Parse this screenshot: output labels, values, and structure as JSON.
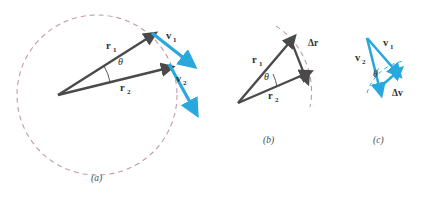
{
  "figure": {
    "type": "physics-vector-diagram",
    "background_color": "#ffffff",
    "panels": [
      {
        "id": "a",
        "caption": "(a)",
        "caption_x": 96,
        "caption_y": 178,
        "description": "Circle with two position vectors r1 and r2 from center separated by angle theta, and tangent velocity vectors v1 and v2 at their tips"
      },
      {
        "id": "b",
        "caption": "(b)",
        "caption_x": 268,
        "caption_y": 140,
        "description": "Triangle of r1 and r2 with displacement vector delta-r joining their tips, arc of circle dashed"
      },
      {
        "id": "c",
        "caption": "(c)",
        "caption_x": 378,
        "caption_y": 140,
        "description": "Triangle of v1 and v2 with velocity-change vector delta-v joining their tips, arc dashed"
      }
    ],
    "labels": {
      "r1": "r",
      "r1_sub": "1",
      "r2": "r",
      "r2_sub": "2",
      "v1": "v",
      "v1_sub": "1",
      "v2": "v",
      "v2_sub": "2",
      "theta": "θ",
      "delta_r": "Δr",
      "delta_v": "Δv"
    },
    "colors": {
      "position_vector": "#4a4a4a",
      "velocity_vector": "#29a8dd",
      "circle_dash": "#c49aa6",
      "text": "#2f2f2f",
      "caption": "#4a4a4a"
    },
    "geometry": {
      "circle": {
        "cx": 97,
        "cy": 95,
        "r": 80,
        "dash": "5 4"
      },
      "panel_a": {
        "origin": {
          "x": 58,
          "y": 95
        },
        "r1_tip": {
          "x": 150,
          "y": 36
        },
        "r2_tip": {
          "x": 166,
          "y": 67
        },
        "v1_start": {
          "x": 153,
          "y": 34
        },
        "v1_end": {
          "x": 187,
          "y": 61
        },
        "v2_start": {
          "x": 170,
          "y": 65
        },
        "v2_end": {
          "x": 193,
          "y": 107
        }
      },
      "panel_b": {
        "origin": {
          "x": 238,
          "y": 103
        },
        "r1_tip": {
          "x": 291,
          "y": 41
        },
        "r2_tip": {
          "x": 305,
          "y": 73
        },
        "dr_start": {
          "x": 293,
          "y": 44
        },
        "dr_end": {
          "x": 306,
          "y": 77
        }
      },
      "panel_c": {
        "apex": {
          "x": 367,
          "y": 38
        },
        "v1_tip": {
          "x": 396,
          "y": 71
        },
        "v2_tip": {
          "x": 381,
          "y": 88
        },
        "dv_start": {
          "x": 380,
          "y": 88
        },
        "dv_end": {
          "x": 397,
          "y": 75
        }
      }
    }
  }
}
